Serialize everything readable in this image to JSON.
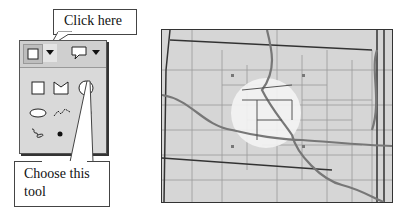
{
  "callouts": {
    "top": {
      "text": "Click here"
    },
    "bottom": {
      "line1": "Choose this",
      "line2": "tool"
    }
  },
  "toolbar": {
    "buttons": [
      {
        "icon": "rectangle-icon",
        "state": "selected"
      },
      {
        "icon": "dropdown-arrow-icon"
      },
      {
        "icon": "speech-bubble-icon"
      },
      {
        "icon": "dropdown-arrow-icon"
      }
    ]
  },
  "palette": {
    "tools": [
      {
        "icon": "rectangle-tool-icon"
      },
      {
        "icon": "polygon-tool-icon"
      },
      {
        "icon": "circle-tool-icon",
        "highlighted": true
      },
      {
        "icon": "ellipse-tool-icon"
      },
      {
        "icon": "polyline-tool-icon"
      },
      {
        "icon": "freehand-line-tool-icon"
      },
      {
        "icon": "freehand-polygon-tool-icon"
      },
      {
        "icon": "point-tool-icon"
      }
    ]
  },
  "map": {
    "colors": {
      "background": "#d6d6d6",
      "county_lines": "#9a9a9a",
      "state_lines": "#333333",
      "rivers": "#777777",
      "circle": "#f4f4f4"
    }
  }
}
